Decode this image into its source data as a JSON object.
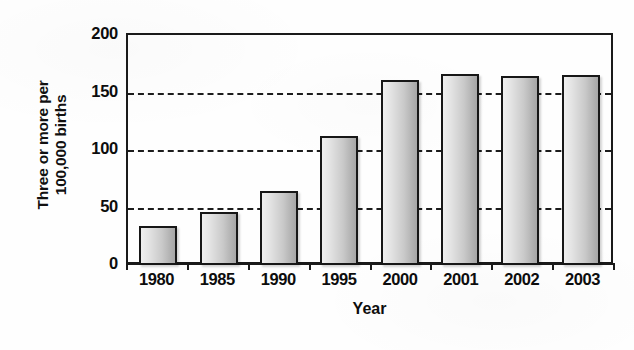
{
  "chart_data": {
    "type": "bar",
    "title": "",
    "subtitle": "",
    "xlabel": "Year",
    "ylabel": "Three or more per 100,000 births",
    "ylabel_lines": [
      "Three or more per",
      "100,000 births"
    ],
    "categories": [
      "1980",
      "1985",
      "1990",
      "1995",
      "2000",
      "2001",
      "2002",
      "2003"
    ],
    "values": [
      34,
      46,
      64,
      112,
      161,
      166,
      164,
      165
    ],
    "ylim": [
      0,
      200
    ],
    "yticks": [
      0,
      50,
      100,
      150,
      200
    ],
    "ytick_labels": [
      "0",
      "50",
      "100",
      "150",
      "200"
    ],
    "gridlines": [
      50,
      100,
      150
    ],
    "grid": true,
    "grid_style": "dashed",
    "legend": false,
    "legend_position": "none",
    "bar_fill_light": "#efefef",
    "bar_fill_dark": "#a6a6a6",
    "bar_outline": "#171717",
    "axis_color": "#1a1a1a",
    "text_color": "#0d0d0d",
    "background": "#ffffff"
  }
}
